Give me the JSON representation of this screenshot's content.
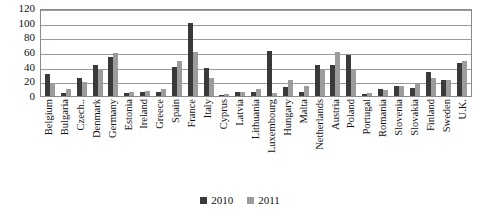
{
  "chart_data": {
    "type": "bar",
    "title": "",
    "subtitle": "",
    "xlabel": "",
    "ylabel": "",
    "ylim": [
      0,
      120
    ],
    "yticks": [
      120,
      100,
      80,
      60,
      40,
      20,
      0
    ],
    "grid": true,
    "legend_position": "bottom-center",
    "categories": [
      "Belgium",
      "Bulgaria",
      "Czech..",
      "Denmark",
      "Germany",
      "Estonia",
      "Ireland",
      "Greece",
      "Spain",
      "France",
      "Italy",
      "Cyprus",
      "Latvia",
      "Lithuania",
      "Luxembourg",
      "Hungary",
      "Malta",
      "Netherlands",
      "Austria",
      "Poland",
      "Portugal",
      "Romania",
      "Slovenia",
      "Slovakia",
      "Finland",
      "Sweden",
      "U.K."
    ],
    "series": [
      {
        "name": "2010",
        "color": "#3a3a3a",
        "values": [
          30,
          4,
          24,
          42,
          53,
          4,
          6,
          6,
          40,
          100,
          38,
          2,
          5,
          6,
          62,
          12,
          5,
          42,
          42,
          56,
          3,
          10,
          13,
          11,
          33,
          22,
          45
        ]
      },
      {
        "name": "2011",
        "color": "#9c9c9c",
        "values": [
          18,
          9,
          19,
          36,
          59,
          6,
          7,
          9,
          48,
          60,
          25,
          3,
          5,
          10,
          4,
          22,
          13,
          36,
          60,
          36,
          4,
          8,
          13,
          17,
          25,
          22,
          48
        ]
      }
    ]
  },
  "legend": {
    "items": [
      {
        "label": "2010",
        "color": "#3a3a3a"
      },
      {
        "label": "2011",
        "color": "#9c9c9c"
      }
    ]
  }
}
